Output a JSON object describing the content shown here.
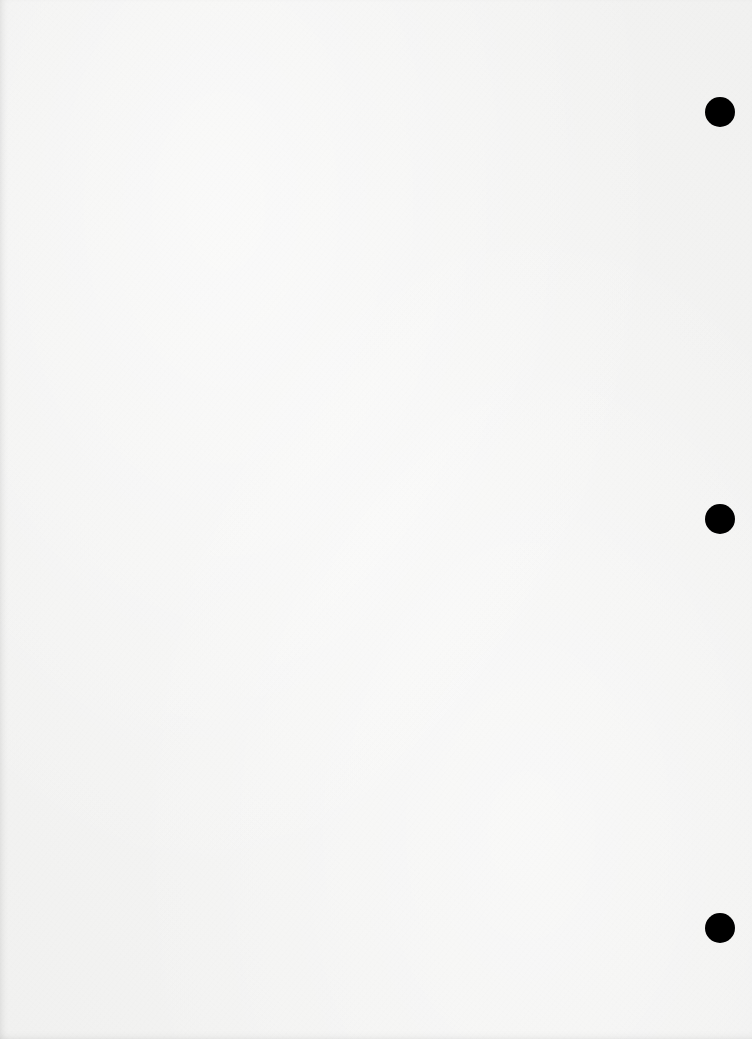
{
  "document": {
    "type": "blank three-hole-punched sheet",
    "background_color": "#f4f4f3",
    "text": ""
  },
  "punch_holes": [
    {
      "id": "top",
      "cx": 720,
      "cy": 112,
      "diameter": 30,
      "color": "#000000"
    },
    {
      "id": "middle",
      "cx": 720,
      "cy": 519,
      "diameter": 30,
      "color": "#000000"
    },
    {
      "id": "bottom",
      "cx": 720,
      "cy": 928,
      "diameter": 30,
      "color": "#000000"
    }
  ]
}
